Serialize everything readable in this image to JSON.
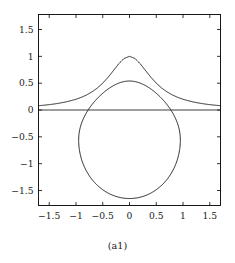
{
  "figure": {
    "caption": "(a1)",
    "background_color": "#ffffff",
    "frame_color": "#000000",
    "curve_color": "#1a1a1a"
  },
  "chart_data": {
    "type": "line",
    "title": "",
    "subtitle": "",
    "xlabel": "",
    "ylabel": "",
    "xlim": [
      -1.7,
      1.7
    ],
    "ylim": [
      -1.78,
      1.78
    ],
    "grid": false,
    "legend": null,
    "xticks": [
      -1.5,
      -1,
      -0.5,
      0,
      0.5,
      1,
      1.5
    ],
    "xticklabels": [
      "-1.5",
      "-1",
      "-0.5",
      "0",
      "0.5",
      "1",
      "1.5"
    ],
    "yticks": [
      -1.5,
      -1,
      -0.5,
      0,
      0.5,
      1,
      1.5
    ],
    "yticklabels": [
      "-1.5",
      "-1",
      "-0.5",
      "0",
      "0.5",
      "1",
      "1.5"
    ],
    "annotations": [],
    "series": [
      {
        "name": "zero-axis-line",
        "style": "solid",
        "x": [
          -1.7,
          1.7
        ],
        "values": [
          0,
          0
        ]
      },
      {
        "name": "upper-bell-curve",
        "style": "solid",
        "x": [
          -1.7,
          -1.6,
          -1.5,
          -1.4,
          -1.3,
          -1.2,
          -1.1,
          -1.0,
          -0.9,
          -0.8,
          -0.7,
          -0.6,
          -0.5,
          -0.4,
          -0.3,
          -0.2,
          -0.1,
          0.0,
          0.1,
          0.2,
          0.3,
          0.4,
          0.5,
          0.6,
          0.7,
          0.8,
          0.9,
          1.0,
          1.1,
          1.2,
          1.3,
          1.4,
          1.5,
          1.6,
          1.7
        ],
        "values": [
          0.08,
          0.089,
          0.1,
          0.113,
          0.129,
          0.148,
          0.172,
          0.2,
          0.236,
          0.281,
          0.338,
          0.41,
          0.5,
          0.61,
          0.735,
          0.862,
          0.962,
          1.0,
          0.962,
          0.862,
          0.735,
          0.61,
          0.5,
          0.41,
          0.338,
          0.281,
          0.236,
          0.2,
          0.172,
          0.148,
          0.129,
          0.113,
          0.1,
          0.089,
          0.08
        ]
      },
      {
        "name": "closed-teardrop-curve",
        "style": "closed-loop",
        "x_extent": [
          -0.95,
          0.95
        ],
        "y_extent": [
          -1.65,
          0.54
        ],
        "top_point": [
          0.0,
          0.54
        ],
        "bottom_point": [
          0.0,
          -1.65
        ],
        "left_point": [
          -0.95,
          -0.48
        ],
        "right_point": [
          0.95,
          -0.48
        ]
      }
    ]
  }
}
